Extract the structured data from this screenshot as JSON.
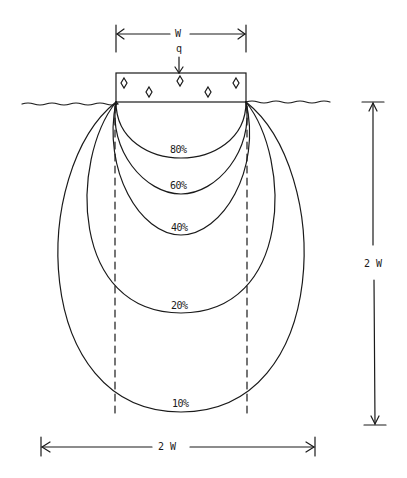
{
  "diagram": {
    "footing": {
      "width_label": "W",
      "load_label": "q"
    },
    "dimensions": {
      "depth_label": "2 W",
      "breadth_label": "2 W"
    },
    "bulbs": [
      {
        "label": "80%",
        "value": 80
      },
      {
        "label": "60%",
        "value": 60
      },
      {
        "label": "40%",
        "value": 40
      },
      {
        "label": "20%",
        "value": 20
      },
      {
        "label": "10%",
        "value": 10
      }
    ],
    "colors": {
      "line": "#1a1a1a",
      "background": "#ffffff"
    }
  }
}
